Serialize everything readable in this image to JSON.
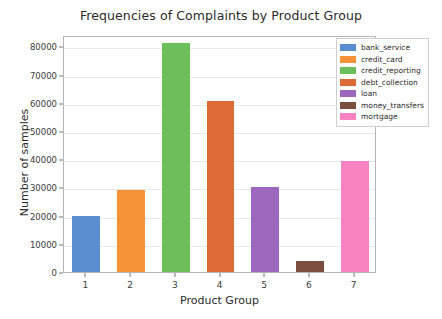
{
  "chart_data": {
    "type": "bar",
    "title": "Frequencies of Complaints by Product Group",
    "xlabel": "Product Group",
    "ylabel": "Number of samples",
    "categories": [
      "1",
      "2",
      "3",
      "4",
      "5",
      "6",
      "7"
    ],
    "values": [
      20000,
      29200,
      81000,
      60500,
      30300,
      3800,
      39300
    ],
    "ylim": [
      0,
      84000
    ],
    "yticks": [
      0,
      10000,
      20000,
      30000,
      40000,
      50000,
      60000,
      70000,
      80000
    ],
    "ytick_labels": [
      "0",
      "10000",
      "20000",
      "30000",
      "40000",
      "50000",
      "60000",
      "70000",
      "80000"
    ],
    "grid": true,
    "grid_axis": "y",
    "legend_position": "upper right",
    "bar_colors": [
      "#5b8ed0",
      "#f59237",
      "#6cbf5a",
      "#dd6b35",
      "#9b68bd",
      "#7b4e3f",
      "#f983c0"
    ],
    "legend": [
      {
        "label": "bank_service",
        "color": "#5b8ed0"
      },
      {
        "label": "credit_card",
        "color": "#f59237"
      },
      {
        "label": "credit_reporting",
        "color": "#6cbf5a"
      },
      {
        "label": "debt_collection",
        "color": "#dd6b35"
      },
      {
        "label": "loan",
        "color": "#9b68bd"
      },
      {
        "label": "money_transfers",
        "color": "#7b4e3f"
      },
      {
        "label": "mortgage",
        "color": "#f983c0"
      }
    ]
  }
}
